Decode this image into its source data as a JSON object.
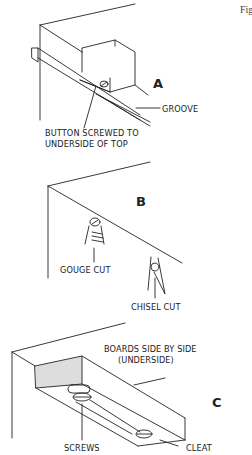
{
  "figure": {
    "caption_fragment": "Fig"
  },
  "panel_a": {
    "letter": "A",
    "labels": {
      "groove": "GROOVE",
      "button_line1": "BUTTON SCREWED TO",
      "button_line2": "UNDERSIDE OF TOP"
    }
  },
  "panel_b": {
    "letter": "B",
    "labels": {
      "gouge": "GOUGE CUT",
      "chisel": "CHISEL CUT"
    }
  },
  "panel_c": {
    "letter": "C",
    "labels": {
      "boards_line1": "BOARDS SIDE BY SIDE",
      "boards_line2": "(UNDERSIDE)",
      "screws": "SCREWS",
      "cleat": "CLEAT"
    }
  },
  "colors": {
    "ink": "#222222",
    "background": "#ffffff"
  }
}
